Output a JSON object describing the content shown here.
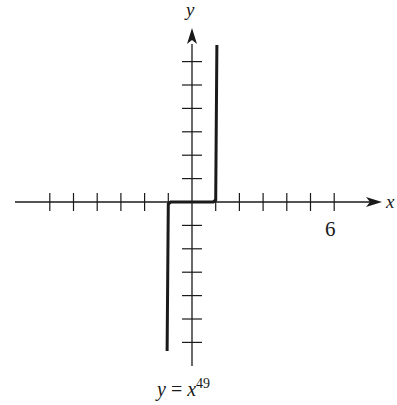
{
  "chart_data": {
    "type": "line",
    "caption": {
      "base": "y = x",
      "exponent": "49"
    },
    "xlabel": "x",
    "ylabel": "y",
    "x_tick_label": "6",
    "x_tick_label_value": 6,
    "x_ticks": [
      -6,
      -5,
      -4,
      -3,
      -2,
      -1,
      1,
      2,
      3,
      4,
      5,
      6
    ],
    "y_ticks": [
      -6,
      -5,
      -4,
      -3,
      -2,
      -1,
      1,
      2,
      3,
      4,
      5,
      6
    ],
    "xlim": [
      -7.3,
      8
    ],
    "ylim": [
      -6.9,
      7.3
    ],
    "grid": false,
    "legend": null,
    "series": [
      {
        "name": "y = x^49",
        "points": [
          [
            -1.05,
            -6.3
          ],
          [
            -1,
            -1
          ],
          [
            -0.9,
            0
          ],
          [
            0,
            0
          ],
          [
            0.9,
            0
          ],
          [
            1,
            1
          ],
          [
            1.05,
            6.6
          ]
        ],
        "color": "#1a1a1a"
      }
    ]
  },
  "colors": {
    "ink": "#1a1a1a",
    "background": "#ffffff"
  }
}
